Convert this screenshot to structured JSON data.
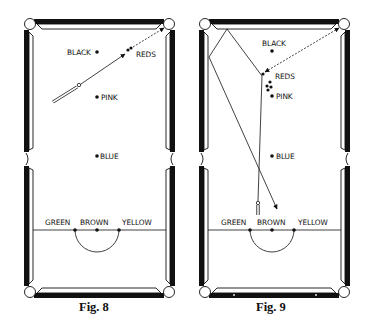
{
  "figures": [
    {
      "caption": "Fig. 8",
      "labels": {
        "black": "BLACK",
        "reds": "REDS",
        "pink": "PINK",
        "blue": "BLUE",
        "green": "GREEN",
        "brown": "BROWN",
        "yellow": "YELLOW"
      }
    },
    {
      "caption": "Fig. 9",
      "labels": {
        "black": "BLACK",
        "reds": "REDS",
        "pink": "PINK",
        "blue": "BLUE",
        "green": "GREEN",
        "brown": "BROWN",
        "yellow": "YELLOW"
      }
    }
  ],
  "colors": {
    "ink": "#111111",
    "paper": "#ffffff",
    "cushion_dark": "#111111"
  }
}
